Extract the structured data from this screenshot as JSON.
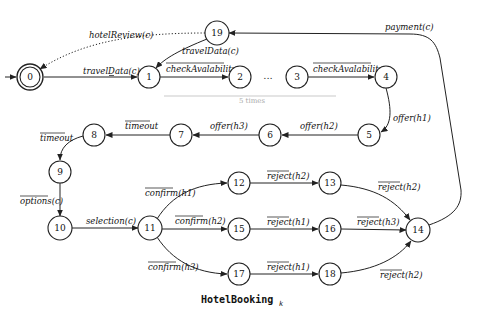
{
  "caption": {
    "text": "HotelBooking",
    "subscript": "k"
  },
  "states": [
    {
      "id": "0",
      "x": 30,
      "y": 77,
      "initial": true,
      "accepting": true
    },
    {
      "id": "1",
      "x": 149,
      "y": 77
    },
    {
      "id": "2",
      "x": 240,
      "y": 77
    },
    {
      "id": "3",
      "x": 297,
      "y": 77
    },
    {
      "id": "4",
      "x": 386,
      "y": 77
    },
    {
      "id": "19",
      "x": 217,
      "y": 33
    },
    {
      "id": "5",
      "x": 369,
      "y": 135
    },
    {
      "id": "6",
      "x": 270,
      "y": 135
    },
    {
      "id": "7",
      "x": 181,
      "y": 135
    },
    {
      "id": "8",
      "x": 94,
      "y": 135
    },
    {
      "id": "9",
      "x": 60,
      "y": 172
    },
    {
      "id": "10",
      "x": 60,
      "y": 228
    },
    {
      "id": "11",
      "x": 150,
      "y": 228
    },
    {
      "id": "12",
      "x": 239,
      "y": 183
    },
    {
      "id": "13",
      "x": 330,
      "y": 183
    },
    {
      "id": "14",
      "x": 418,
      "y": 230
    },
    {
      "id": "15",
      "x": 239,
      "y": 229
    },
    {
      "id": "16",
      "x": 330,
      "y": 229
    },
    {
      "id": "17",
      "x": 239,
      "y": 274
    },
    {
      "id": "18",
      "x": 330,
      "y": 274
    }
  ],
  "labels": {
    "e0_1": "travelData(c)",
    "e1_2": "checkAvalability",
    "e3_4": "checkAvalability",
    "e4_5": "offer(h1)",
    "e5_6": "offer(h2)",
    "e6_7": "offer(h3)",
    "e7_8": "timeout",
    "e8_9": "timeout",
    "e9_10": "options(c)",
    "e10_11": "selection(c)",
    "e11_12": "confirm(h1)",
    "e11_15": "confirm(h2)",
    "e11_17": "confirm(h3)",
    "e12_13": "reject(h2)",
    "e15_16": "reject(h1)",
    "e17_18": "reject(h1)",
    "e13_14": "reject(h2)",
    "e16_14": "reject(h3)",
    "e18_14": "reject(h2)",
    "e14_19": "payment(c)",
    "e19_1": "travelData(c)",
    "e19_0": "hotelReview(c)",
    "ellipsis": "...",
    "repeat": "5 times"
  },
  "transitions": [
    {
      "from": "0",
      "to": "1",
      "label": "travelData(c)",
      "overline": false
    },
    {
      "from": "1",
      "to": "2",
      "label": "checkAvalability",
      "overline": true
    },
    {
      "from": "3",
      "to": "4",
      "label": "checkAvalability",
      "overline": true
    },
    {
      "from": "4",
      "to": "5",
      "label": "offer(h1)",
      "overline": false
    },
    {
      "from": "5",
      "to": "6",
      "label": "offer(h2)",
      "overline": false
    },
    {
      "from": "6",
      "to": "7",
      "label": "offer(h3)",
      "overline": false
    },
    {
      "from": "7",
      "to": "8",
      "label": "timeout",
      "overline": true
    },
    {
      "from": "8",
      "to": "9",
      "label": "timeout",
      "overline": true
    },
    {
      "from": "9",
      "to": "10",
      "label": "options(c)",
      "overline": true
    },
    {
      "from": "10",
      "to": "11",
      "label": "selection(c)",
      "overline": false
    },
    {
      "from": "11",
      "to": "12",
      "label": "confirm(h1)",
      "overline": true
    },
    {
      "from": "11",
      "to": "15",
      "label": "confirm(h2)",
      "overline": true
    },
    {
      "from": "11",
      "to": "17",
      "label": "confirm(h3)",
      "overline": true
    },
    {
      "from": "12",
      "to": "13",
      "label": "reject(h2)",
      "overline": true
    },
    {
      "from": "15",
      "to": "16",
      "label": "reject(h1)",
      "overline": true
    },
    {
      "from": "17",
      "to": "18",
      "label": "reject(h1)",
      "overline": true
    },
    {
      "from": "13",
      "to": "14",
      "label": "reject(h2)",
      "overline": true
    },
    {
      "from": "16",
      "to": "14",
      "label": "reject(h3)",
      "overline": true
    },
    {
      "from": "18",
      "to": "14",
      "label": "reject(h2)",
      "overline": true
    },
    {
      "from": "14",
      "to": "19",
      "label": "payment(c)",
      "overline": false
    },
    {
      "from": "19",
      "to": "1",
      "label": "travelData(c)",
      "overline": false
    },
    {
      "from": "19",
      "to": "0",
      "label": "hotelReview(c)",
      "overline": false,
      "dotted": true
    }
  ]
}
